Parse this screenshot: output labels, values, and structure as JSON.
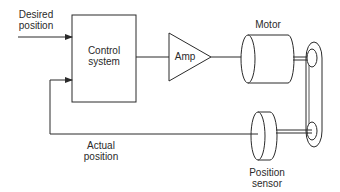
{
  "diagram": {
    "nodes": {
      "desired_position": {
        "line1": "Desired",
        "line2": "position"
      },
      "control_system": {
        "line1": "Control",
        "line2": "system"
      },
      "amp": {
        "label": "Amp"
      },
      "motor": {
        "label": "Motor"
      },
      "position_sensor": {
        "line1": "Position",
        "line2": "sensor"
      },
      "actual_position": {
        "line1": "Actual",
        "line2": "position"
      }
    },
    "edges": [
      {
        "from": "desired_position",
        "to": "control_system"
      },
      {
        "from": "control_system",
        "to": "amp"
      },
      {
        "from": "amp",
        "to": "motor"
      },
      {
        "from": "motor",
        "to": "belt_pulley"
      },
      {
        "from": "belt_pulley",
        "to": "position_sensor"
      },
      {
        "from": "position_sensor",
        "to": "control_system",
        "label": "Actual position"
      }
    ],
    "colors": {
      "stroke": "#2a2a2a",
      "background": "#ffffff"
    }
  }
}
